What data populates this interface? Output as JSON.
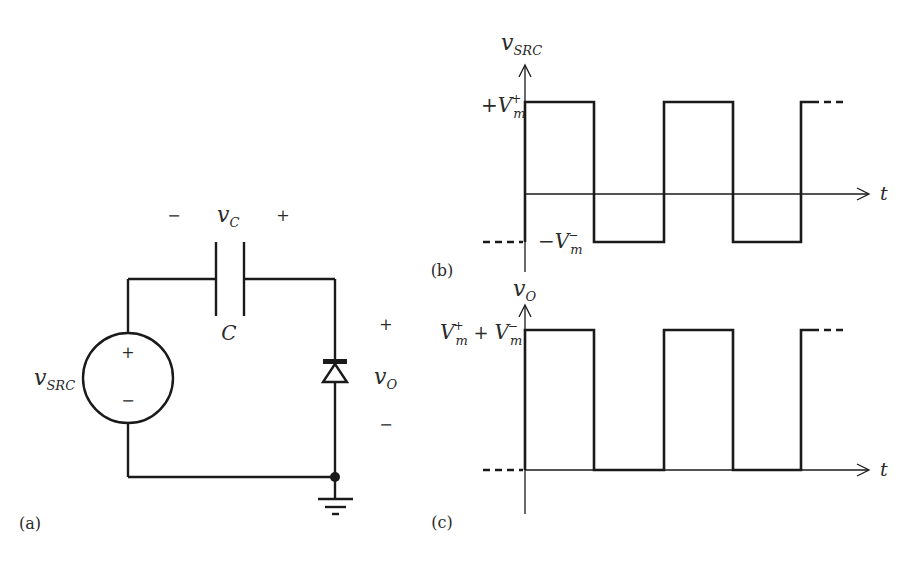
{
  "figure": {
    "panels": [
      {
        "id": "a",
        "label": "(a)",
        "type": "circuit"
      },
      {
        "id": "b",
        "label": "(b)",
        "type": "waveform"
      },
      {
        "id": "c",
        "label": "(c)",
        "type": "waveform"
      }
    ]
  },
  "circuit": {
    "source": {
      "name": "v",
      "subscript": "SRC",
      "plus": "+",
      "minus": "−"
    },
    "capacitor": {
      "name": "C",
      "voltage_name": "v",
      "voltage_subscript": "C",
      "left_polarity": "−",
      "right_polarity": "+"
    },
    "diode": {
      "orientation": "cathode-up"
    },
    "output": {
      "name": "v",
      "subscript": "O",
      "plus": "+",
      "minus": "−"
    },
    "ground": {
      "symbol": "ground"
    },
    "panel_label": "(a)"
  },
  "plot_b": {
    "panel_label": "(b)",
    "y_axis": {
      "name": "v",
      "subscript": "SRC"
    },
    "x_axis": {
      "name": "t"
    },
    "high_label": {
      "prefix": "+V",
      "sub": "m",
      "sup": "+"
    },
    "low_label": {
      "prefix": "−V",
      "sub": "m",
      "sup": "−"
    }
  },
  "plot_c": {
    "panel_label": "(c)",
    "y_axis": {
      "name": "v",
      "subscript": "O"
    },
    "x_axis": {
      "name": "t"
    },
    "high_label": {
      "a": "V",
      "a_sub": "m",
      "a_sup": "+",
      "op": " + ",
      "b": "V",
      "b_sub": "m",
      "b_sup": "−"
    }
  },
  "colors": {
    "ink": "#1a1a1a",
    "background": "#ffffff"
  }
}
